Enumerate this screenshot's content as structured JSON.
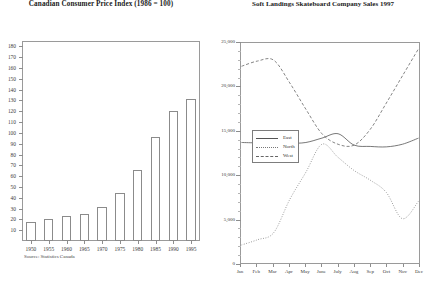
{
  "page": {
    "background": "#ffffff",
    "width": 435,
    "height": 298
  },
  "charts": [
    {
      "id": "cpi",
      "title": "Canadian Consumer Price Index (1986 = 100)",
      "source_note": "Source: Statistics Canada"
    },
    {
      "id": "sales",
      "title": "Soft Landings Skateboard Company Sales 1997"
    }
  ],
  "legend": {
    "position": "inside-left-middle",
    "items": [
      {
        "label": "East",
        "style": "solid",
        "color": "#555555"
      },
      {
        "label": "North",
        "style": "dotted",
        "color": "#777777"
      },
      {
        "label": "West",
        "style": "dashed",
        "color": "#666666"
      }
    ]
  },
  "chart_data": [
    {
      "type": "bar",
      "title": "Canadian Consumer Price Index (1986 = 100)",
      "xlabel": "",
      "ylabel": "",
      "categories": [
        "1950",
        "1955",
        "1960",
        "1965",
        "1970",
        "1975",
        "1980",
        "1985",
        "1990",
        "1995"
      ],
      "values": [
        18,
        20,
        23,
        25,
        31,
        44,
        66,
        96,
        120,
        131
      ],
      "ylim": [
        0,
        185
      ],
      "yticks": [
        10,
        20,
        30,
        40,
        50,
        60,
        70,
        80,
        90,
        100,
        110,
        120,
        130,
        140,
        150,
        160,
        170,
        180
      ],
      "ytick_labels": [
        "10",
        "20",
        "30",
        "40",
        "50",
        "60",
        "70",
        "80",
        "90",
        "100",
        "110",
        "120",
        "130",
        "140",
        "150",
        "160",
        "170",
        "180"
      ],
      "grid": false,
      "bar_fill": "#ffffff",
      "bar_stroke": "#8b8b8b",
      "annotations": [
        "Source: Statistics Canada"
      ]
    },
    {
      "type": "line",
      "title": "Soft Landings Skateboard Company Sales 1997",
      "xlabel": "",
      "ylabel": "",
      "x": [
        "Jan",
        "Feb",
        "Mar",
        "Apr",
        "May",
        "June",
        "July",
        "Aug",
        "Sep",
        "Oct",
        "Nov",
        "Dec"
      ],
      "ylim": [
        0,
        25000
      ],
      "yticks": [
        0,
        5000,
        10000,
        15000,
        20000,
        25000
      ],
      "ytick_labels": [
        "0",
        "5,000",
        "10,000",
        "15,000",
        "20,000",
        "25,000"
      ],
      "grid": false,
      "legend": [
        "East",
        "North",
        "West"
      ],
      "series": [
        {
          "name": "East",
          "style": "solid",
          "color": "#555555",
          "values": [
            13700,
            13650,
            13600,
            13600,
            13700,
            14200,
            14700,
            13400,
            13250,
            13200,
            13500,
            14200
          ]
        },
        {
          "name": "North",
          "style": "dotted",
          "color": "#777777",
          "values": [
            2000,
            2600,
            3400,
            7200,
            10300,
            13500,
            12000,
            10500,
            9400,
            8000,
            5000,
            7000
          ]
        },
        {
          "name": "West",
          "style": "dashed",
          "color": "#666666",
          "values": [
            22400,
            23000,
            23100,
            20500,
            17500,
            14700,
            13500,
            13400,
            15200,
            18200,
            21300,
            24400
          ]
        }
      ]
    }
  ]
}
